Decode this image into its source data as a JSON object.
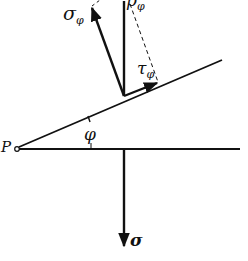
{
  "diagram": {
    "colors": {
      "line": "#111111",
      "background": "#ffffff"
    },
    "labels": {
      "point": "P",
      "angle": "φ",
      "normal_stress": "σ",
      "inclined_normal": {
        "symbol": "σ",
        "subscript": "φ"
      },
      "inclined_shear": {
        "symbol": "τ",
        "subscript": "φ"
      },
      "resultant": {
        "symbol": "p",
        "subscript": "φ"
      }
    }
  }
}
